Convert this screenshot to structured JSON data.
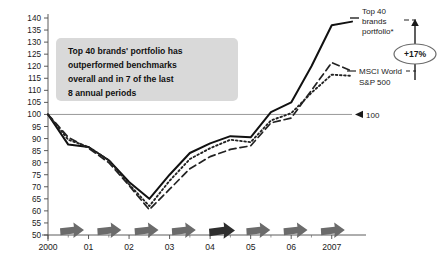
{
  "callout": {
    "lines": [
      "Top 40 brands' portfolio has",
      "outperformed benchmarks",
      "overall and in 7 of the last",
      "8 annual periods"
    ],
    "bg_color": "#d9d9d9"
  },
  "annotations": {
    "series_label_top40_l1": "Top 40",
    "series_label_top40_l2": "brands",
    "series_label_top40_l3": "portfolio*",
    "series_label_msci": "MSCI World",
    "series_label_sp": "S&P 500",
    "delta_badge": "+17%",
    "baseline_label": "100"
  },
  "axis": {
    "y_ticks": [
      "140",
      "135",
      "130",
      "125",
      "120",
      "115",
      "110",
      "105",
      "100",
      "95",
      "90",
      "85",
      "80",
      "75",
      "70",
      "65",
      "60",
      "55",
      "50"
    ],
    "y_min": 50,
    "y_max": 140,
    "x_ticks": [
      "2000",
      "01",
      "02",
      "03",
      "04",
      "05",
      "06",
      "2007"
    ]
  },
  "arrows": {
    "count": 8,
    "normal_color": "#6b6b6b",
    "highlight_color": "#2e2e2e",
    "highlight_index": 4
  },
  "chart_data": {
    "type": "line",
    "title": "",
    "subtitle": "",
    "xlabel": "",
    "ylabel": "",
    "ylim": [
      50,
      140
    ],
    "grid": false,
    "legend_position": "right-inline",
    "baseline": 100,
    "x": [
      "2000",
      "2000.5",
      "01",
      "01.5",
      "02",
      "02.5",
      "03",
      "03.5",
      "04",
      "04.5",
      "05",
      "05.5",
      "06",
      "06.5",
      "2007",
      "2007.5"
    ],
    "series": [
      {
        "name": "Top 40 brands portfolio*",
        "style": "solid",
        "color": "#111111",
        "values": [
          100,
          87.5,
          86.5,
          81,
          72,
          65,
          75,
          84,
          88,
          91,
          90.5,
          101,
          105,
          120,
          137,
          138.5
        ]
      },
      {
        "name": "MSCI World",
        "style": "dashed",
        "color": "#222222",
        "values": [
          100,
          90.5,
          86,
          80,
          70.5,
          60.5,
          69,
          77.5,
          82.5,
          85.5,
          87,
          96.5,
          98.5,
          110,
          121.5,
          118
        ]
      },
      {
        "name": "S&P 500",
        "style": "dotted",
        "color": "#222222",
        "values": [
          100,
          89.5,
          86.5,
          81,
          71,
          62,
          72.5,
          81.5,
          86,
          89.5,
          88.5,
          97.5,
          100.5,
          109,
          116.5,
          116
        ]
      }
    ]
  }
}
